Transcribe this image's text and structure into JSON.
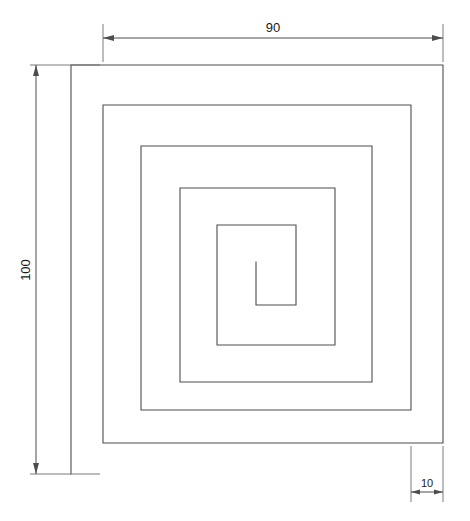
{
  "drawing": {
    "title": "Square spiral profile part drawing",
    "view_type": "orthographic-front-view",
    "background_color": "#ffffff",
    "line_color": "#4d4d4d",
    "text_color": "#1a1a1a",
    "units": "mm"
  },
  "dimensions": {
    "width": {
      "label": "width-dimension",
      "value": "90",
      "orientation": "horizontal",
      "position": "top"
    },
    "height": {
      "label": "height-dimension",
      "value": "100",
      "orientation": "vertical-rotated",
      "position": "left"
    },
    "thickness": {
      "label": "thickness-dimension",
      "value": "10",
      "orientation": "horizontal",
      "position": "bottom-right"
    }
  },
  "geometry": {
    "description": "Continuous square spiral of constant 10 unit wall thickness wound inward counter-clockwise over five turns",
    "spiral_turns": 5,
    "wall_thickness": "10",
    "outer_width": "90",
    "outer_height": "100",
    "outer_path": "M 71 474 L 71 65 L 443 65 L 443 443 L 103 443 L 103 105 L 411 105 L 411 410 L 141 410 L 141 146 L 372 146 L 372 382 L 180 382 L 180 188 L 335 188 L 335 345 L 217 345 L 217 225 L 296 225 L 296 305 L 256 305 L 256 262",
    "extension_lines": [
      {
        "name": "top-left-extension",
        "x1": 103,
        "y1": 60,
        "x2": 103,
        "y2": 22
      },
      {
        "name": "top-right-extension",
        "x1": 443,
        "y1": 60,
        "x2": 443,
        "y2": 22
      },
      {
        "name": "left-top-extension",
        "x1": 98,
        "y1": 65,
        "x2": 30,
        "y2": 65
      },
      {
        "name": "left-bottom-extension",
        "x1": 98,
        "y1": 474,
        "x2": 30,
        "y2": 474
      },
      {
        "name": "bottom-right-extension-inner",
        "x1": 411,
        "y1": 448,
        "x2": 411,
        "y2": 500
      },
      {
        "name": "bottom-right-extension-outer",
        "x1": 443,
        "y1": 448,
        "x2": 443,
        "y2": 500
      }
    ]
  }
}
